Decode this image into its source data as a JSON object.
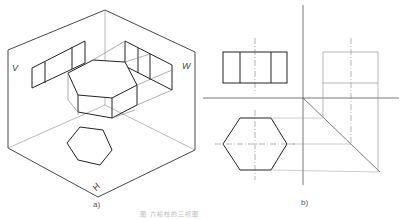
{
  "figure": {
    "caption": "图 六棱柱的三视图",
    "panel_a": {
      "label": "a)",
      "planes": {
        "v": "V",
        "w": "W",
        "h": "H"
      },
      "description": "Isometric view of hexagonal prism in three-plane projection box"
    },
    "panel_b": {
      "label": "b)",
      "description": "Orthographic views: front view (rectangle with 2 vertical edges), top view (hexagon), side view (rectangle) with 45° miter line projection construction"
    }
  },
  "colors": {
    "line": "#222222",
    "thin": "#888888",
    "bg": "#ffffff"
  }
}
